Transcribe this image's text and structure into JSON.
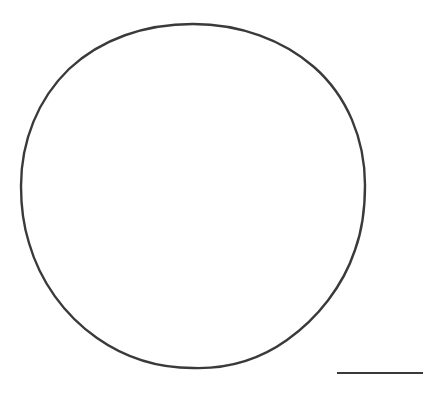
{
  "figure": {
    "kind": "line-drawing",
    "subject_label": "circular object outline",
    "title": "",
    "caption": "",
    "background_color": "#ffffff",
    "ink_color": "#3a3a3a",
    "canvas": {
      "width": 444,
      "height": 399
    }
  },
  "outline": {
    "name": "circle-outline",
    "shape": "circle",
    "center_x": 193,
    "center_y": 196,
    "radius_x": 172,
    "radius_y": 172,
    "bbox": {
      "left": 21,
      "top": 24,
      "right": 365,
      "bottom": 368
    },
    "stroke_width": 2.4,
    "stroke_color": "#3a3a3a",
    "fill": "none",
    "hand_drawn": true,
    "path": "M 193 24 C 240 24 283 40 314 67 C 347 96 365 139 365 185 C 365 209 362 231 355 250 C 343 286 318 318 287 340 C 259 360 227 369 193 368 C 157 368 124 357 97 338 C 64 315 40 281 29 243 C 23 224 21 205 21 186 C 21 141 38 99 69 69 C 101 39 145 24 193 24 Z"
  },
  "scale_bar": {
    "name": "scale-bar",
    "label": "",
    "x_start": 337,
    "x_end": 423,
    "y": 373,
    "length_px": 86,
    "stroke_width": 2.2,
    "stroke_color": "#3a3a3a"
  },
  "annotations": {
    "items": []
  }
}
